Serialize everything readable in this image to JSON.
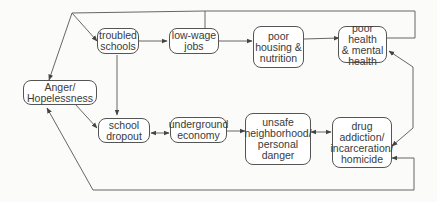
{
  "diagram": {
    "type": "flowchart",
    "colors": {
      "line": "#555555",
      "box_border": "#555555",
      "text": "#3a3a3a",
      "background": "#fbfbfa"
    },
    "nodes": {
      "anger": {
        "label": "Anger/\nHopelessness"
      },
      "troubled_schools": {
        "label": "troubled\nschools"
      },
      "low_wage_jobs": {
        "label": "low-wage\njobs"
      },
      "poor_housing": {
        "label": "poor\nhousing &\nnutrition"
      },
      "poor_health": {
        "label": "poor health\n& mental\nhealth"
      },
      "school_dropout": {
        "label": "school\ndropout"
      },
      "underground_economy": {
        "label": "underground\neconomy"
      },
      "unsafe_neighborhood": {
        "label": "unsafe\nneighborhood/\npersonal\ndanger"
      },
      "drug_addiction": {
        "label": "drug\naddiction/\nincarceration/\nhomicide"
      }
    },
    "edges": [
      {
        "from": "anger",
        "to": "troubled_schools",
        "direction": "forward"
      },
      {
        "from": "troubled_schools",
        "to": "low_wage_jobs",
        "direction": "forward"
      },
      {
        "from": "low_wage_jobs",
        "to": "poor_housing",
        "direction": "forward"
      },
      {
        "from": "poor_housing",
        "to": "poor_health",
        "direction": "forward"
      },
      {
        "from": "poor_health",
        "to": "anger",
        "direction": "forward",
        "route": "top loop"
      },
      {
        "from": "troubled_schools",
        "to": "school_dropout",
        "direction": "forward"
      },
      {
        "from": "anger",
        "to": "school_dropout",
        "direction": "forward"
      },
      {
        "from": "school_dropout",
        "to": "underground_economy",
        "direction": "both"
      },
      {
        "from": "underground_economy",
        "to": "unsafe_neighborhood",
        "direction": "forward"
      },
      {
        "from": "unsafe_neighborhood",
        "to": "drug_addiction",
        "direction": "both"
      },
      {
        "from": "poor_health",
        "to": "drug_addiction",
        "direction": "both"
      },
      {
        "from": "drug_addiction",
        "to": "anger",
        "direction": "both",
        "route": "bottom loop"
      }
    ]
  }
}
